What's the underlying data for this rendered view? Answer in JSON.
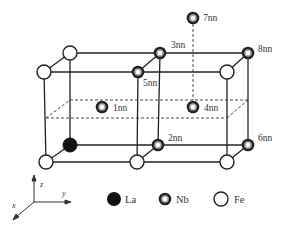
{
  "diagram": {
    "title": "",
    "site_labels": {
      "nn1": "1nn",
      "nn2": "2nn",
      "nn3": "3nn",
      "nn4": "4nn",
      "nn5": "5nn",
      "nn6": "6nn",
      "nn7": "7nn",
      "nn8": "8nn"
    },
    "axes": {
      "z": "z",
      "y": "y",
      "x": "x"
    },
    "legend": [
      {
        "symbol": "filled-circle",
        "label": "La"
      },
      {
        "symbol": "double-ring-circle",
        "label": "Nb"
      },
      {
        "symbol": "open-circle",
        "label": "Fe"
      }
    ],
    "colors": {
      "line": "#222222",
      "atom_fill_fe": "#ffffff",
      "atom_fill_la": "#111111",
      "nb_ring": "#222222",
      "nb_inner": "#bbbbbb"
    }
  }
}
